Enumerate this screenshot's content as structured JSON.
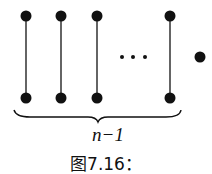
{
  "diagram": {
    "type": "graph",
    "edges": [
      {
        "x": 26,
        "top_y": 16,
        "bottom_y": 98
      },
      {
        "x": 61,
        "top_y": 16,
        "bottom_y": 98
      },
      {
        "x": 97,
        "top_y": 16,
        "bottom_y": 98
      },
      {
        "x": 170,
        "top_y": 16,
        "bottom_y": 98
      }
    ],
    "ellipsis": "···",
    "isolated_vertex": {
      "x": 200,
      "y": 57
    },
    "brace_label": "n−1",
    "caption": "图7.16："
  },
  "colors": {
    "ink": "#111111",
    "background": "#ffffff"
  }
}
